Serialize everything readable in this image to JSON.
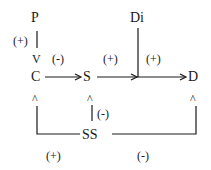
{
  "nodes": {
    "P": "P",
    "C": "C",
    "S": "S",
    "Di": "Di",
    "D": "D",
    "SS": "SS"
  },
  "edges": {
    "P_to_C": "(+)",
    "C_to_S": "(-)",
    "S_to_D": "(+)",
    "Di_to_D": "(+)",
    "SS_to_S": "(-)",
    "SS_to_C": "(+)",
    "SS_to_D": "(-)"
  },
  "arrowheads": {
    "down": "V",
    "up": "^"
  },
  "colors": {
    "ink": "#1a1a1a",
    "background": "#ffffff"
  }
}
